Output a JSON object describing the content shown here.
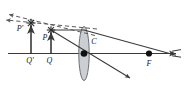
{
  "figure": {
    "kind": "optics-ray-diagram",
    "title": "",
    "background_color": "#ffffff",
    "line_color": "#3a3a3a",
    "dashed_color": "#5a5a5a",
    "lens_fill": "#b9bfc4",
    "lens_stroke": "#5a5a5a",
    "marker_color": "#111111",
    "label_color": "#1a1a1a"
  },
  "labels": {
    "image_point": "P'",
    "object_point": "P",
    "image_foot": "Q'",
    "object_foot": "Q",
    "lens_centre": "C",
    "focal_point": "F"
  },
  "geometry": {
    "axis": {
      "x1": 8,
      "y1": 53.5,
      "x2": 181,
      "y2": 53.5
    },
    "lens": {
      "cx": 84,
      "cy": 53.5,
      "rx": 5.2,
      "ry": 27
    },
    "points": {
      "P_prime": {
        "x": 31,
        "y": 23
      },
      "P": {
        "x": 51,
        "y": 30
      },
      "Q_prime": {
        "x": 31,
        "y": 53.5
      },
      "Q": {
        "x": 51,
        "y": 53.5
      },
      "C": {
        "x": 84,
        "y": 53.5
      },
      "F": {
        "x": 149,
        "y": 53.5
      }
    }
  },
  "elements": {
    "axis_name": "principal-axis",
    "object_arrow_name": "object-arrow-PQ",
    "image_arrow_name": "image-arrow-P-prime-Q-prime",
    "lens_name": "converging-lens",
    "ray_parallel_name": "ray-parallel-to-axis",
    "ray_through_centre_name": "ray-through-optical-centre",
    "ray_refracted_name": "refracted-ray-to-focus",
    "dashed_extension_upper_name": "dashed-virtual-ray-upper",
    "dashed_extension_lower_name": "dashed-virtual-ray-lower"
  }
}
